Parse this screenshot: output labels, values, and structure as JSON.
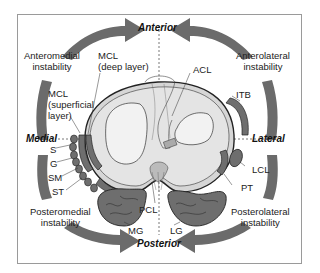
{
  "diagram": {
    "type": "anatomical cross-section (knee, superior view of tibial plateau)",
    "colors": {
      "arrow": "#6b6b6b",
      "tibia_fill": "#d6d6d6",
      "meniscus_fill": "#e9e9e9",
      "muscle_fill": "#6e6e6e",
      "frame": "#9a9a9a",
      "text": "#222222"
    },
    "directions": {
      "anterior": "Anterior",
      "posterior": "Posterior",
      "medial": "Medial",
      "lateral": "Lateral"
    },
    "instability_labels": {
      "anteromedial": [
        "Anteromedial",
        "instability"
      ],
      "anterolateral": [
        "Anterolateral",
        "instability"
      ],
      "posteromedial": [
        "Posteromedial",
        "instability"
      ],
      "posterolateral": [
        "Posterolateral",
        "instability"
      ]
    },
    "structures": {
      "mcl_deep": [
        "MCL",
        "(deep layer)"
      ],
      "mcl_superficial": [
        "MCL",
        "(superficial",
        "layer)"
      ],
      "acl": "ACL",
      "itb": "ITB",
      "s": "S",
      "g": "G",
      "sm": "SM",
      "st": "ST",
      "lcl": "LCL",
      "pt": "PT",
      "pcl": "PCL",
      "mg": "MG",
      "lg": "LG"
    }
  }
}
